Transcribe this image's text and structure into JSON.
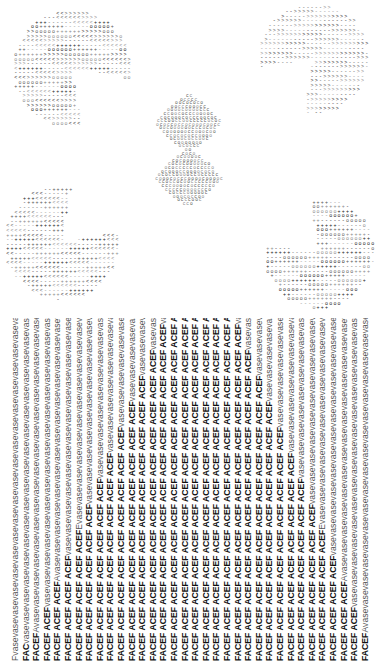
{
  "artwork": {
    "shapes": [
      {
        "name": "pacman-top-left",
        "cx": 70,
        "cy": 70,
        "r": 60,
        "mouth_start": 10,
        "mouth_end": 80,
        "glyph": "+-<>o",
        "tone": "#3a3a3a"
      },
      {
        "name": "pacman-top-right",
        "cx": 312,
        "cy": 60,
        "r": 56,
        "mouth_start": 100,
        "mouth_end": 170,
        "glyph": "->",
        "tone": "#555555"
      },
      {
        "name": "pacman-bottom-left",
        "cx": 60,
        "cy": 244,
        "r": 58,
        "mouth_start": 280,
        "mouth_end": 350,
        "glyph": "-+<",
        "tone": "#444444"
      },
      {
        "name": "pacman-bottom-right",
        "cx": 318,
        "cy": 255,
        "r": 56,
        "mouth_start": 190,
        "mouth_end": 260,
        "glyph": "+-o",
        "tone": "#444444"
      },
      {
        "name": "diamond-center",
        "cx": 188,
        "cy": 152,
        "w": 66,
        "h": 110,
        "glyph": "o",
        "tone": "#666666"
      }
    ]
  },
  "text_columns": {
    "count": 34,
    "spacing_px": 10.6,
    "vase_word": "vase",
    "face_word": "ACEF",
    "lines": [
      {
        "face": "",
        "vase": "Fvasevasevasevasevasevasevasevasevasevasevasevasevasevasevasevasevasevasevasevasevasevasevasevasevasevasevasevasevasevasevasevasev",
        "tail": "F"
      },
      {
        "face": "FAC",
        "vase": "vasevasevasevasevasevasevasevasevasevasevasevasevasevasevasevasevasevasevasevasevasevasevasevasevasevasevasevasevasevasevas",
        "tail": "FAC"
      },
      {
        "face": "FACEF",
        "vase": "Avasevasevasevasevasevasevasevasevasevasevasevasevasevasevasevasevasevasevasevasevasevasevasevasevasevasevasevasevasev",
        "tail": "FACEFA"
      },
      {
        "face": "FACEF ACEF",
        "vase": "vasevasevasevasevasevasevasevasevasevasevasevasevasevasevasevasevasevasevasevasevasevasevasevasevasevasevasevase",
        "tail": "PACEFACE"
      },
      {
        "face": "FACEF ACEF ACEF",
        "vase": "Avasevasevasevasevasevasevasevasevasevasevasevasevasevasevasevasevasevasevasevasevasevasevasevasevasevasev",
        "tail": "FACEFACE"
      },
      {
        "face": "FACEF ACEF ACEF ACEF",
        "vase": "vasevasevasevasevasevasevasevasevasevasevasevasevasevasevasevasevasevasevasevasevasevasevasevasevasevas",
        "tail": "ACEFACEF"
      },
      {
        "face": "FACEF ACEF ACEF ACEF ACEF",
        "vase": "Evasevasevasevasevasevasevasevasevasevasevasevasevasevasevasevasevasevasevasevasevasevasevasevasevase",
        "tail": "FACEFACEF"
      },
      {
        "face": "FACEF ACEF ACEF ACEF ACEF ACEF",
        "vase": "vasevasevasevasevasevasevasevasevasevasevasevasevasevasevasevasevasevasevasevasevasevasevasevasev",
        "tail": "ACEFACEFA"
      },
      {
        "face": "FACEF ACEF ACEF ACEF ACEF ACEF ACEF",
        "vase": "vasevasevasevasevasevasevasevasevasevasevasevasevasevasevasevasevasevasevasevasevasevasevasevas",
        "tail": "FACEFACEFA"
      },
      {
        "face": "FACEF ACEF ACEF ACEF ACEF ACEF ACEF ACEF",
        "vase": "vasevasevasevasevasevasevasevasevasevasevasevasevasevasevasevasevasevasevasevasevasevasevase",
        "tail": "FACEFACEFAC"
      },
      {
        "face": "FACEF ACEF ACEF ACEF ACEF ACEF ACEF ACEF ACEF",
        "vase": "vasevasevasevasevasevasevasevasevasevasevasevasevasevasevasevasevasevasevasevasevasevasev",
        "tail": "FACEFACEFACE"
      },
      {
        "face": "FACEF ACEF ACEF ACEF ACEF ACEF ACEF ACEF ACEF ACEF",
        "vase": "vasevasevasevasevasevasevasevasevasevasevasevasevasevasevasevasevasevasevasevasevasevas",
        "tail": "FACEFACEFACEF"
      },
      {
        "face": "FACEF ACEF ACEF ACEF ACEF ACEF ACEF ACEF ACEF ACEF ACEF",
        "vase": "vasevasevasevasevasevasevasevasevasevasevasevasevasevasevasevasevasevasevasevasevase",
        "tail": "FACEFACEFACEFA"
      },
      {
        "face": "FACEF ACEF ACEF ACEF ACEF ACEF ACEF ACEF ACEF ACEF ACEF ACEF",
        "vase": "vasevasevasevasevasevasevasevasevasevasevasevasevasevasevasevasevasevasevasevasev",
        "tail": "FACEFACEFACEFAC"
      },
      {
        "face": "FACEF ACEF ACEF ACEF ACEF ACEF ACEF ACEF ACEF ACEF ACEF ACEF ACEF",
        "vase": "vasevasevasevasevasevasevasevasevasevasevasevasevasevasevasevasevasevasevasevas",
        "tail": "FACEFACEFACEFACE"
      },
      {
        "face": "FACEF ACEF ACEF ACEF ACEF ACEF ACEF ACEF ACEF ACEF ACEF ACEF ACEF ACEF",
        "vase": "vasevasevasevasevasevasevasevasevasevasevasevasevasevasevasevasevasevasevase",
        "tail": "FACEFACEFACEFACEF"
      },
      {
        "face": "FACEF ACEF ACEF ACEF ACEF ACEF ACEF ACEF ACEF ACEF ACEF ACEF ACEF ACEF ACEF",
        "vase": "vasevasevasevasevasevasevasevasevasevasevasevasevasevasevasevasevasevasev",
        "tail": "FACEFACEFACEFACEFA"
      },
      {
        "face": "FACEF ACEF ACEF ACEF ACEF ACEF ACEF ACEF ACEF ACEF ACEF ACEF ACEF ACEF ACEF ACEF",
        "vase": "vasevasevasevasevasevasevasevasevasevasevasevasevasevasevasevasevasevas",
        "tail": "FACEFACEFACEFACEFAC"
      },
      {
        "face": "FACEF ACEF ACEF ACEF ACEF ACEF ACEF ACEF ACEF ACEF ACEF ACEF ACEF ACEF ACEF ACEF",
        "vase": "vasevasevasevasevasevasevasevasevasevasevasevasevasevasevasevasevasevas",
        "tail": "FACEFACEFACEFACEFAC"
      },
      {
        "face": "FACEF ACEF ACEF ACEF ACEF ACEF ACEF ACEF ACEF ACEF ACEF ACEF ACEF ACEF ACEF",
        "vase": "vasevasevasevasevasevasevasevasevasevasevasevasevasevasevasevasevasevasev",
        "tail": "FACEFACEFACEFACEFA"
      },
      {
        "face": "FACEF ACEF ACEF ACEF ACEF ACEF ACEF ACEF ACEF ACEF ACEF ACEF ACEF ACEF",
        "vase": "vasevasevasevasevasevasevasevasevasevasevasevasevasevasevasevasevasevasevase",
        "tail": "FACEFACEFACEFACEF"
      },
      {
        "face": "FACEF ACEF ACEF ACEF ACEF ACEF ACEF ACEF ACEF ACEF ACEF ACEF ACEF",
        "vase": "vasevasevasevasevasevasevasevasevasevasevasevasevasevasevasevasevasevasevasevas",
        "tail": "FACEFACEFACEFACE"
      },
      {
        "face": "FACEF ACEF ACEF ACEF ACEF ACEF ACEF ACEF ACEF ACEF ACEF ACEF",
        "vase": "vasevasevasevasevasevasevasevasevasevasevasevasevasevasevasevasevasevasevasevasev",
        "tail": "FACEFACEFACEFAC"
      },
      {
        "face": "FACEF ACEF ACEF ACEF ACEF ACEF ACEF ACEF ACEF ACEF ACEF",
        "vase": "vasevasevasevasevasevasevasevasevasevasevasevasevasevasevasevasevasevasevasevasevase",
        "tail": "FACEFACEFACEFA"
      },
      {
        "face": "FACEF ACEF ACEF ACEF ACEF ACEF ACEF ACEF ACEF ACEF",
        "vase": "vasevasevasevasevasevasevasevasevasevasevasevasevasevasevasevasevasevasevasevasevasevas",
        "tail": "FACEFACEFACEF"
      },
      {
        "face": "FACEF ACEF ACEF ACEF ACEF ACEF ACEF ACEF ACEF",
        "vase": "vasevasevasevasevasevasevasevasevasevasevasevasevasevasevasevasevasevasevasevasevasevasev",
        "tail": "FACEFACEFACE"
      },
      {
        "face": "FACEF ACEF ACEF ACEF ACEF ACEF ACEF ACEF",
        "vase": "vasevasevasevasevasevasevasevasevasevasevasevasevasevasevasevasevasevasevasevasevasevasevase",
        "tail": "FACEFACEFAC"
      },
      {
        "face": "FACEF ACEF ACEF ACEF ACEF ACEF ACEF",
        "vase": "vasevasevasevasevasevasevasevasevasevasevasevasevasevasevasevasevasevasevasevasevasevasevasevas",
        "tail": "FACEFACEFA"
      },
      {
        "face": "FACEF ACEF ACEF ACEF ACEF ACEF",
        "vase": "vasevasevasevasevasevasevasevasevasevasevasevasevasevasevasevasevasevasevasevasevasevasevasevasev",
        "tail": "ACEFACEFA"
      },
      {
        "face": "FACEF ACEF ACEF ACEF ACEF",
        "vase": "Evasevasevasevasevasevasevasevasevasevasevasevasevasevasevasevasevasevasevasevasevasevasevasevasevase",
        "tail": "FACEFACEF"
      },
      {
        "face": "FACEF ACEF ACEF ACEF",
        "vase": "vasevasevasevasevasevasevasevasevasevasevasevasevasevasevasevasevasevasevasevasevasevasevasevasevasevas",
        "tail": "ACEFACEF"
      },
      {
        "face": "FACEF ACEF ACEF",
        "vase": "Avasevasevasevasevasevasevasevasevasevasevasevasevasevasevasevasevasevasevasevasevasevasevasevasevasevasev",
        "tail": "FACEFACE"
      },
      {
        "face": "FACEF ACEF",
        "vase": "vasevasevasevasevasevasevasevasevasevasevasevasevasevasevasevasevasevasevasevasevasevasevasevasevasevasevasevase",
        "tail": "PACEFACE"
      },
      {
        "face": "FACEF",
        "vase": "Avasevasevasevasevasevasevasevasevasevasevasevasevasevasevasevasevasevasevasevasevasevasevasevasevasevasevasevasev",
        "tail": "FACEFA"
      }
    ]
  }
}
